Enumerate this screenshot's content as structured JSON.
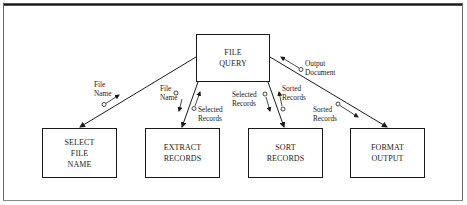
{
  "diagram": {
    "type": "structure-chart",
    "root": {
      "id": "file-query",
      "label": "FILE\nQUERY"
    },
    "modules": [
      {
        "id": "select-file-name",
        "label": "SELECT\nFILE\nNAME"
      },
      {
        "id": "extract-records",
        "label": "EXTRACT\nRECORDS"
      },
      {
        "id": "sort-records",
        "label": "SORT\nRECORDS"
      },
      {
        "id": "format-output",
        "label": "FORMAT\nOUTPUT"
      }
    ],
    "data_flows": [
      {
        "from": "select-file-name",
        "to": "file-query",
        "label": "File\nName"
      },
      {
        "from": "file-query",
        "to": "extract-records",
        "label": "File\nName"
      },
      {
        "from": "extract-records",
        "to": "file-query",
        "label": "Selected\nRecords"
      },
      {
        "from": "file-query",
        "to": "sort-records",
        "label": "Selected\nRecords"
      },
      {
        "from": "sort-records",
        "to": "file-query",
        "label": "Sorted\nRecords"
      },
      {
        "from": "file-query",
        "to": "format-output",
        "label": "Sorted\nRecords"
      },
      {
        "from": "format-output",
        "to": "file-query",
        "label": "Output\nDocument"
      }
    ],
    "colors": {
      "line": "#1a1a1a",
      "background": "#ffffff",
      "frame": "#555555"
    }
  }
}
